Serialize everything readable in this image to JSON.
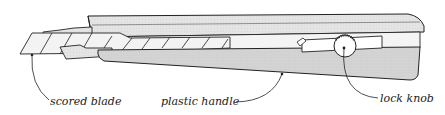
{
  "diagram": {
    "labels": {
      "blade": "scored blade",
      "handle": "plastic handle",
      "knob": "lock knob"
    },
    "colors": {
      "stroke": "#222222",
      "handle_fill": "#d6d6d6",
      "handle_top_fill": "#e2e2e2",
      "blade_fill": "#f2f2f2",
      "slot_fill": "#ffffff",
      "background": "#ffffff"
    }
  }
}
